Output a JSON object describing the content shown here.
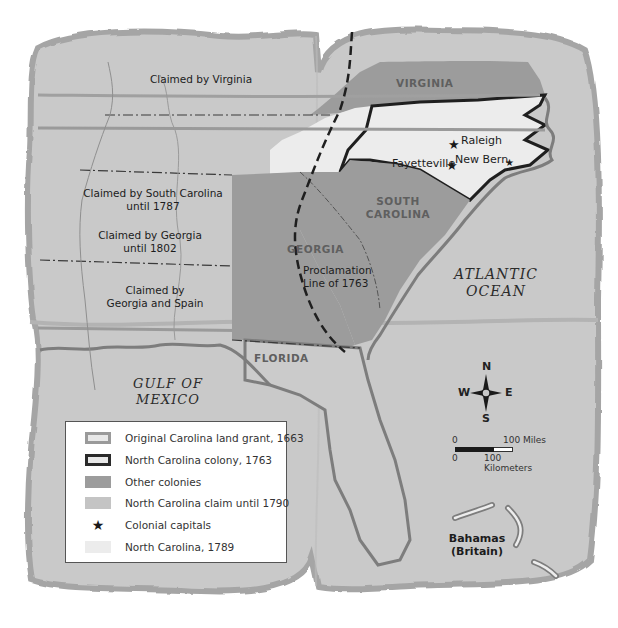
{
  "map": {
    "region_labels": {
      "claimed_virginia": "Claimed by Virginia",
      "claimed_sc": "Claimed by South Carolina",
      "claimed_sc_until": "until 1787",
      "claimed_ga": "Claimed by Georgia",
      "claimed_ga_until": "until 1802",
      "claimed_ga_spain_1": "Claimed by",
      "claimed_ga_spain_2": "Georgia and Spain",
      "virginia": "VIRGINIA",
      "south_carolina_1": "SOUTH",
      "south_carolina_2": "CAROLINA",
      "georgia": "GEORGIA",
      "florida": "FLORIDA",
      "proclamation_1": "Proclamation",
      "proclamation_2": "Line of 1763",
      "bahamas_1": "Bahamas",
      "bahamas_2": "(Britain)"
    },
    "water_labels": {
      "atlantic_1": "ATLANTIC",
      "atlantic_2": "OCEAN",
      "gulf_1": "GULF OF",
      "gulf_2": "MEXICO"
    },
    "cities": [
      {
        "name": "Raleigh",
        "type": "colonial capital"
      },
      {
        "name": "New Bern",
        "type": "colonial capital"
      },
      {
        "name": "Fayetteville",
        "type": "colonial capital"
      }
    ],
    "colors": {
      "parchment": "#c8c8c8",
      "parchment_edge": "#a9a9a9",
      "other_colonies": "#9c9c9c",
      "nc_claim": "#c4c4c4",
      "nc_1789": "#ececec",
      "colony_border": "#1f1f1f",
      "grant_line": "#9a9a9a",
      "coast": "#7d7d7d"
    }
  },
  "legend": {
    "items": [
      {
        "key": "grant",
        "label": "Original Carolina land grant, 1663",
        "icon": "outlined-light-swatch"
      },
      {
        "key": "colony",
        "label": "North Carolina colony, 1763",
        "icon": "outlined-dark-swatch"
      },
      {
        "key": "other",
        "label": "Other colonies",
        "icon": "dark-gray-swatch"
      },
      {
        "key": "claim",
        "label": "North Carolina claim until 1790",
        "icon": "light-gray-swatch"
      },
      {
        "key": "capitals",
        "label": "Colonial capitals",
        "icon": "star-icon"
      },
      {
        "key": "nc1789",
        "label": "North Carolina, 1789",
        "icon": "pale-swatch"
      }
    ]
  },
  "compass": {
    "n": "N",
    "s": "S",
    "e": "E",
    "w": "W"
  },
  "scale": {
    "miles_zero": "0",
    "miles_label": "100 Miles",
    "km_zero": "0",
    "km_label": "100 Kilometers"
  }
}
